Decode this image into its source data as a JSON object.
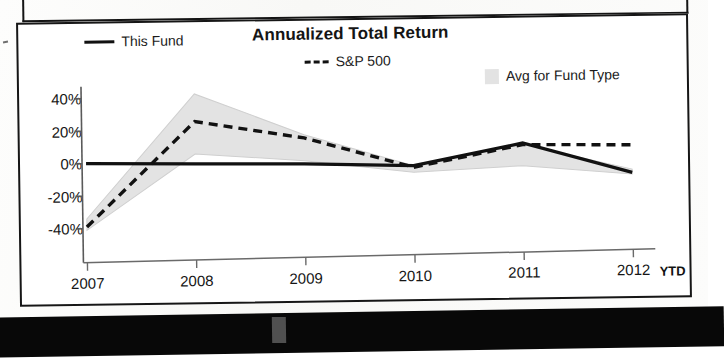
{
  "chart_data": {
    "type": "line",
    "title": "Annualized Total Return",
    "xlabel": "",
    "ylabel": "",
    "categories": [
      "2007",
      "2008",
      "2009",
      "2010",
      "2011",
      "2012"
    ],
    "x_tick_labels": [
      "2007",
      "2008",
      "2009",
      "2010",
      "2011",
      "2012"
    ],
    "x_axis_note": "YTD",
    "y_tick_labels": [
      "40%",
      "20%",
      "0%",
      "-20%",
      "-40%"
    ],
    "y_tick_values": [
      40,
      20,
      0,
      -20,
      -40
    ],
    "ylim": [
      -45,
      45
    ],
    "grid": false,
    "legend_position": "top",
    "series": [
      {
        "name": "This Fund",
        "style": "solid",
        "color": "#111111",
        "values": [
          0,
          -1,
          -2,
          -4,
          9,
          -10
        ]
      },
      {
        "name": "S&P 500",
        "style": "dashed",
        "color": "#111111",
        "values": [
          -39,
          25,
          14,
          -5,
          8,
          7
        ]
      }
    ],
    "band": {
      "name": "Avg for Fund Type",
      "style": "filled",
      "color": "#e3e3e3",
      "upper": [
        -34,
        42,
        16,
        -4,
        8,
        -8
      ],
      "lower": [
        -41,
        5,
        0,
        -8,
        -5,
        -11
      ]
    }
  },
  "legend": {
    "items": [
      {
        "label": "This Fund",
        "marker": "solid-line-icon"
      },
      {
        "label": "S&P 500",
        "marker": "dashed-line-icon"
      },
      {
        "label": "Avg for Fund Type",
        "marker": "band-swatch-icon"
      }
    ]
  }
}
